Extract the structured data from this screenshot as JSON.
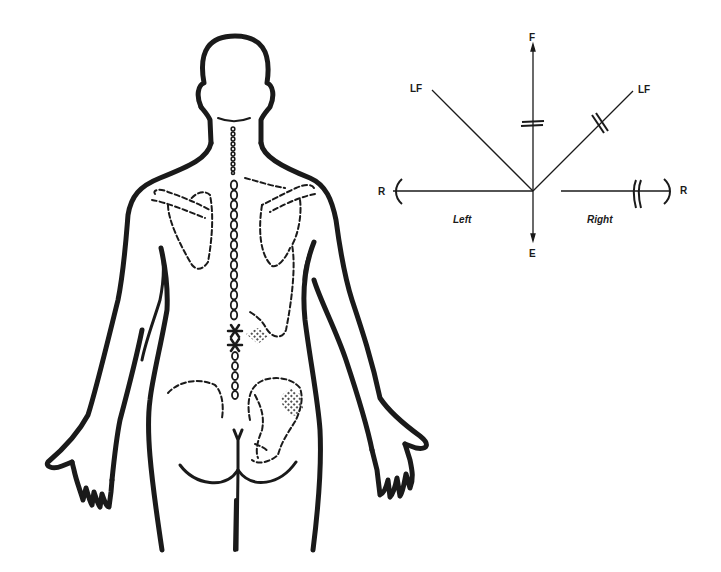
{
  "figure": {
    "body_diagram": {
      "view": "posterior",
      "markers": [
        {
          "name": "lesion-marker-upper",
          "type": "asterisk"
        },
        {
          "name": "lesion-marker-lower",
          "type": "asterisk"
        }
      ],
      "shaded_regions": [
        "lumbar-paraspinal-right",
        "sacroiliac-right"
      ]
    },
    "motion_diagram": {
      "labels": {
        "flexion": "F",
        "extension": "E",
        "lateral_flexion_left": "LF",
        "lateral_flexion_right": "LF",
        "rotation_left": "R",
        "rotation_right": "R",
        "side_left": "Left",
        "side_right": "Right"
      },
      "restrictions": {
        "flexion": "=",
        "lateral_flexion_right": "//",
        "rotation_right": "||"
      }
    },
    "colors": {
      "ink": "#1a1a1a",
      "background": "#ffffff"
    }
  }
}
